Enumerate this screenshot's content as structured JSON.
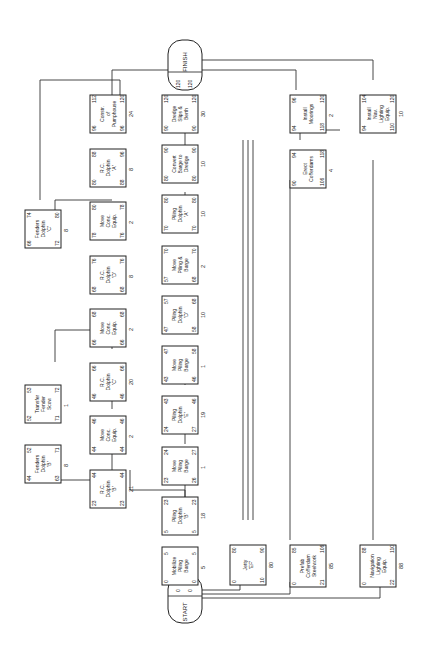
{
  "diagram": {
    "type": "CPM activity network (rotated 90° counter-clockwise)",
    "start": {
      "label": "START",
      "es": "0",
      "ef": "0"
    },
    "finish": {
      "label": "FINISH",
      "es": "120",
      "ef": "120"
    },
    "activities": [
      {
        "id": "a1",
        "label": "Mobilize Piling Barge",
        "es": "0",
        "ef": "5",
        "ls": "0",
        "lf": "5",
        "dur": "5"
      },
      {
        "id": "a2",
        "label": "Piling Dolphin 'B'",
        "es": "5",
        "ef": "23",
        "ls": "5",
        "lf": "23",
        "dur": "18"
      },
      {
        "id": "a3",
        "label": "Move Piling Barge",
        "es": "23",
        "ef": "24",
        "ls": "26",
        "lf": "27",
        "dur": "1"
      },
      {
        "id": "a4",
        "label": "Piling Dolphin 'E'",
        "es": "24",
        "ef": "43",
        "ls": "27",
        "lf": "46",
        "dur": "19"
      },
      {
        "id": "a5",
        "label": "Move Piling Barge",
        "es": "43",
        "ef": "47",
        "ls": "46",
        "lf": "58",
        "dur": "1"
      },
      {
        "id": "a6",
        "label": "Piling Dolphin 'D'",
        "es": "47",
        "ef": "57",
        "ls": "58",
        "lf": "68",
        "dur": "10"
      },
      {
        "id": "a7",
        "label": "Move Piling & Barge",
        "es": "57",
        "ef": "70",
        "ls": "68",
        "lf": "70",
        "dur": "2"
      },
      {
        "id": "a8",
        "label": "Piling Dolphin 'A'",
        "es": "70",
        "ef": "80",
        "ls": "70",
        "lf": "80",
        "dur": "10"
      },
      {
        "id": "a9",
        "label": "Convert Barge to Dredge",
        "es": "80",
        "ef": "90",
        "ls": "80",
        "lf": "90",
        "dur": "10"
      },
      {
        "id": "a10",
        "label": "Dredge Slips & Berth",
        "es": "90",
        "ef": "120",
        "ls": "90",
        "lf": "120",
        "dur": "30"
      },
      {
        "id": "b1",
        "label": "R.C. Dolphin 'B'",
        "es": "23",
        "ef": "44",
        "ls": "23",
        "lf": "44",
        "dur": "21"
      },
      {
        "id": "b2",
        "label": "Move Conc. Equip.",
        "es": "44",
        "ef": "46",
        "ls": "44",
        "lf": "46",
        "dur": "2"
      },
      {
        "id": "b3",
        "label": "R.C. Dolphin 'C'",
        "es": "46",
        "ef": "66",
        "ls": "46",
        "lf": "66",
        "dur": "20"
      },
      {
        "id": "b4",
        "label": "Move Conc. Equip.",
        "es": "66",
        "ef": "68",
        "ls": "66",
        "lf": "68",
        "dur": "2"
      },
      {
        "id": "b5",
        "label": "R.C. Dolphin 'D'",
        "es": "68",
        "ef": "76",
        "ls": "68",
        "lf": "76",
        "dur": "8"
      },
      {
        "id": "b6",
        "label": "Move Conc. Equip.",
        "es": "78",
        "ef": "80",
        "ls": "76",
        "lf": "78",
        "dur": "2"
      },
      {
        "id": "b7",
        "label": "R.C. Dolphin 'A'",
        "es": "80",
        "ef": "88",
        "ls": "88",
        "lf": "96",
        "dur": "8"
      },
      {
        "id": "b8",
        "label": "Constr. of Pumphouse",
        "es": "96",
        "ef": "112",
        "ls": "96",
        "lf": "120",
        "dur": "24"
      },
      {
        "id": "c1",
        "label": "Fenders Dolphin 'B'",
        "es": "44",
        "ef": "52",
        "ls": "63",
        "lf": "71",
        "dur": "8"
      },
      {
        "id": "c2",
        "label": "Transfer Fender Scow",
        "es": "52",
        "ef": "53",
        "ls": "71",
        "lf": "72",
        "dur": "1"
      },
      {
        "id": "c3",
        "label": "Fenders Dolphin 'C'",
        "es": "66",
        "ef": "74",
        "ls": "72",
        "lf": "80",
        "dur": "8"
      },
      {
        "id": "d1",
        "label": "Jetty 'EF'",
        "es": "0",
        "ef": "80",
        "ls": "10",
        "lf": "90",
        "dur": "80"
      },
      {
        "id": "e1",
        "label": "Prefab Cofferdam Steelwork",
        "es": "0",
        "ef": "85",
        "ls": "21",
        "lf": "106",
        "dur": "85"
      },
      {
        "id": "e2",
        "label": "Erect Cofferdams",
        "es": "90",
        "ef": "94",
        "ls": "106",
        "lf": "118",
        "dur": "4"
      },
      {
        "id": "e3",
        "label": "Install Moorings",
        "es": "94",
        "ef": "96",
        "ls": "118",
        "lf": "120",
        "dur": "2"
      },
      {
        "id": "f1",
        "label": "Navigation Lighting Equip.",
        "es": "0",
        "ef": "88",
        "ls": "22",
        "lf": "110",
        "dur": "88"
      },
      {
        "id": "f2",
        "label": "Install Nav. Lighting Equip.",
        "es": "94",
        "ef": "104",
        "ls": "110",
        "lf": "120",
        "dur": "10"
      }
    ]
  }
}
